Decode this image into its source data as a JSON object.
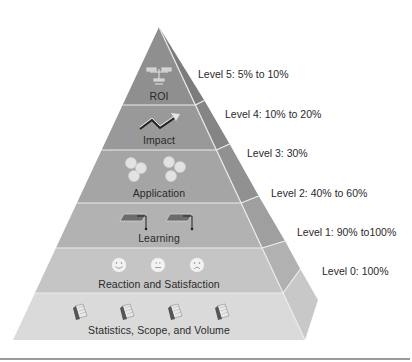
{
  "diagram": {
    "type": "pyramid",
    "colors": {
      "tier5_front": "#8e8e8e",
      "tier4_front": "#999999",
      "tier3_front": "#a6a6a6",
      "tier2_front": "#b3b3b3",
      "tier1_front": "#c4c4c4",
      "tier0_front": "#d9d9d9",
      "side_shade": "#7a7a7a",
      "divider": "#e8e8e8",
      "text": "#2a2a2a"
    },
    "tiers": [
      {
        "level": 5,
        "name": "ROI",
        "icon": "scale-balance-icon",
        "level_label": "Level 5: 5% to 10%"
      },
      {
        "level": 4,
        "name": "Impact",
        "icon": "trend-arrow-icon",
        "level_label": "Level 4: 10% to 20%"
      },
      {
        "level": 3,
        "name": "Application",
        "icon": "gears-icon",
        "level_label": "Level 3: 30%"
      },
      {
        "level": 2,
        "name": "Learning",
        "icon": "graduation-cap-icon",
        "level_label": "Level 2: 40% to 60%"
      },
      {
        "level": 1,
        "name": "Reaction and Satisfaction",
        "icon": "smiley-faces-icon",
        "level_label": "Level 1: 90% to100%"
      },
      {
        "level": 0,
        "name": "Statistics, Scope, and Volume",
        "icon": "calendar-icon",
        "level_label": "Level 0: 100%"
      }
    ]
  }
}
